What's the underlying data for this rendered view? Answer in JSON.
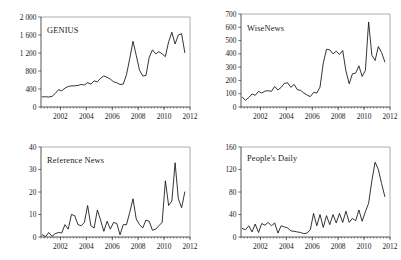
{
  "figure": {
    "background": "#ffffff",
    "line_color": "#111111",
    "axis_color": "#2b2b2b",
    "frame_color": "#9a9a9a",
    "panel_count": 4
  },
  "chart_data": [
    {
      "type": "line",
      "title": "GENIUS",
      "xlabel": "",
      "ylabel": "",
      "grid": false,
      "legend": "none",
      "xlim": [
        2000.5,
        2012.0
      ],
      "ylim": [
        0,
        2000
      ],
      "xticks": [
        2002,
        2004,
        2006,
        2008,
        2010,
        2012
      ],
      "xtick_labels": [
        "2002",
        "2004",
        "2006",
        "2008",
        "2010",
        "2012"
      ],
      "yticks": [
        0,
        400,
        800,
        1200,
        1600,
        2000
      ],
      "ytick_labels": [
        "0",
        "400",
        "800",
        "1 200",
        "1 600",
        "2 000"
      ],
      "series": [
        {
          "name": "GENIUS",
          "x": [
            2000.6,
            2000.85,
            2001.1,
            2001.35,
            2001.6,
            2001.85,
            2002.1,
            2002.35,
            2002.6,
            2002.85,
            2003.1,
            2003.35,
            2003.6,
            2003.85,
            2004.1,
            2004.35,
            2004.6,
            2004.85,
            2005.1,
            2005.35,
            2005.6,
            2005.85,
            2006.1,
            2006.35,
            2006.6,
            2006.85,
            2007.1,
            2007.35,
            2007.6,
            2007.85,
            2008.1,
            2008.35,
            2008.6,
            2008.85,
            2009.1,
            2009.35,
            2009.6,
            2009.85,
            2010.1,
            2010.35,
            2010.6,
            2010.85,
            2011.1,
            2011.35,
            2011.6
          ],
          "values": [
            225,
            228,
            222,
            235,
            300,
            385,
            360,
            420,
            455,
            470,
            470,
            480,
            500,
            490,
            540,
            510,
            580,
            560,
            640,
            690,
            660,
            620,
            560,
            540,
            500,
            510,
            720,
            1080,
            1460,
            1150,
            820,
            690,
            700,
            1100,
            1270,
            1180,
            1230,
            1180,
            1120,
            1450,
            1660,
            1400,
            1600,
            1630,
            1210
          ]
        }
      ]
    },
    {
      "type": "line",
      "title": "WiseNews",
      "xlabel": "",
      "ylabel": "",
      "grid": false,
      "legend": "none",
      "xlim": [
        2000.5,
        2012.0
      ],
      "ylim": [
        0,
        700
      ],
      "xticks": [
        2002,
        2004,
        2006,
        2008,
        2010,
        2012
      ],
      "xtick_labels": [
        "2002",
        "2004",
        "2006",
        "2008",
        "2010",
        "2012"
      ],
      "yticks": [
        0,
        100,
        200,
        300,
        400,
        500,
        600,
        700
      ],
      "ytick_labels": [
        "0",
        "100",
        "200",
        "300",
        "400",
        "500",
        "600",
        "700"
      ],
      "series": [
        {
          "name": "WiseNews",
          "x": [
            2000.6,
            2000.85,
            2001.1,
            2001.35,
            2001.6,
            2001.85,
            2002.1,
            2002.35,
            2002.6,
            2002.85,
            2003.1,
            2003.35,
            2003.6,
            2003.85,
            2004.1,
            2004.35,
            2004.6,
            2004.85,
            2005.1,
            2005.35,
            2005.6,
            2005.85,
            2006.1,
            2006.35,
            2006.6,
            2006.85,
            2007.1,
            2007.35,
            2007.6,
            2007.85,
            2008.1,
            2008.35,
            2008.6,
            2008.85,
            2009.1,
            2009.35,
            2009.6,
            2009.85,
            2010.1,
            2010.35,
            2010.6,
            2010.85,
            2011.1,
            2011.35,
            2011.6
          ],
          "values": [
            75,
            50,
            72,
            98,
            88,
            118,
            105,
            120,
            122,
            118,
            155,
            128,
            148,
            178,
            182,
            148,
            170,
            130,
            125,
            105,
            90,
            78,
            110,
            105,
            150,
            330,
            435,
            430,
            400,
            420,
            395,
            425,
            270,
            175,
            250,
            255,
            310,
            230,
            275,
            640,
            390,
            350,
            455,
            410,
            340
          ]
        }
      ]
    },
    {
      "type": "line",
      "title": "Reference News",
      "xlabel": "",
      "ylabel": "",
      "grid": false,
      "legend": "none",
      "xlim": [
        2000.5,
        2012.0
      ],
      "ylim": [
        0,
        40
      ],
      "xticks": [
        2002,
        2004,
        2006,
        2008,
        2010,
        2012
      ],
      "xtick_labels": [
        "2002",
        "2004",
        "2006",
        "2008",
        "2010",
        "2012"
      ],
      "yticks": [
        0,
        10,
        20,
        30,
        40
      ],
      "ytick_labels": [
        "0",
        "10",
        "20",
        "30",
        "40"
      ],
      "series": [
        {
          "name": "Reference News",
          "x": [
            2000.6,
            2000.85,
            2001.1,
            2001.35,
            2001.6,
            2001.85,
            2002.1,
            2002.35,
            2002.6,
            2002.85,
            2003.1,
            2003.35,
            2003.6,
            2003.85,
            2004.1,
            2004.35,
            2004.6,
            2004.85,
            2005.1,
            2005.35,
            2005.6,
            2005.85,
            2006.1,
            2006.35,
            2006.6,
            2006.85,
            2007.1,
            2007.35,
            2007.6,
            2007.85,
            2008.1,
            2008.35,
            2008.6,
            2008.85,
            2009.1,
            2009.35,
            2009.6,
            2009.85,
            2010.1,
            2010.35,
            2010.6,
            2010.85,
            2011.1,
            2011.35,
            2011.6
          ],
          "values": [
            1.0,
            0.2,
            2.0,
            0.3,
            1.5,
            2.0,
            1.8,
            5.5,
            3.5,
            10.0,
            9.5,
            5.5,
            5.0,
            6.5,
            14.0,
            5.0,
            4.0,
            12.0,
            7.5,
            2.5,
            7.0,
            3.5,
            6.5,
            6.0,
            1.0,
            5.5,
            5.5,
            11.0,
            17.0,
            8.0,
            5.5,
            4.0,
            7.5,
            7.0,
            3.0,
            3.5,
            5.0,
            6.5,
            25.0,
            14.0,
            16.0,
            33.0,
            17.0,
            13.0,
            20.0
          ]
        }
      ]
    },
    {
      "type": "line",
      "title": "People's Daily",
      "xlabel": "",
      "ylabel": "",
      "grid": false,
      "legend": "none",
      "xlim": [
        2000.5,
        2012.0
      ],
      "ylim": [
        0,
        160
      ],
      "xticks": [
        2002,
        2004,
        2006,
        2008,
        2010,
        2012
      ],
      "xtick_labels": [
        "2002",
        "2004",
        "2006",
        "2008",
        "2010",
        "2012"
      ],
      "yticks": [
        0,
        40,
        80,
        120,
        160
      ],
      "ytick_labels": [
        "0",
        "40",
        "80",
        "120",
        "160"
      ],
      "series": [
        {
          "name": "People's Daily",
          "x": [
            2000.6,
            2000.85,
            2001.1,
            2001.35,
            2001.6,
            2001.85,
            2002.1,
            2002.35,
            2002.6,
            2002.85,
            2003.1,
            2003.35,
            2003.6,
            2003.85,
            2004.1,
            2004.35,
            2004.6,
            2004.85,
            2005.1,
            2005.35,
            2005.6,
            2005.85,
            2006.1,
            2006.35,
            2006.6,
            2006.85,
            2007.1,
            2007.35,
            2007.6,
            2007.85,
            2008.1,
            2008.35,
            2008.6,
            2008.85,
            2009.1,
            2009.35,
            2009.6,
            2009.85,
            2010.1,
            2010.35,
            2010.6,
            2010.85,
            2011.1,
            2011.35,
            2011.6
          ],
          "values": [
            15,
            13,
            20,
            9,
            23,
            8,
            24,
            21,
            26,
            20,
            25,
            7,
            20,
            18,
            16,
            11,
            10,
            9,
            8,
            6,
            7,
            13,
            42,
            20,
            40,
            17,
            38,
            22,
            40,
            25,
            42,
            26,
            46,
            26,
            33,
            29,
            48,
            28,
            45,
            60,
            100,
            133,
            120,
            95,
            72
          ]
        }
      ]
    }
  ]
}
